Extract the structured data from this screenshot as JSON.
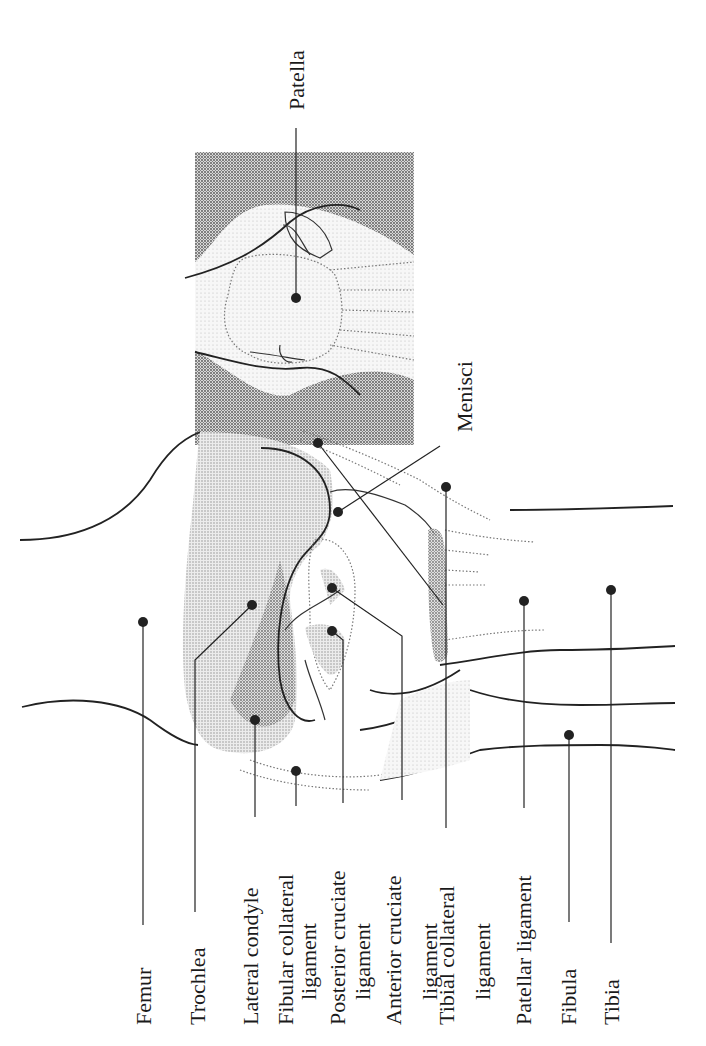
{
  "diagram": {
    "orientation": "rotated -90 degrees; labels read bottom-to-top",
    "labels": {
      "patella": "Patella",
      "menisci": "Menisci",
      "femur": "Femur",
      "trochlea": "Trochlea",
      "lateral_condyle": "Lateral condyle",
      "fibular_collateral_1": "Fibular collateral",
      "fibular_collateral_2": "ligament",
      "posterior_cruciate_1": "Posterior cruciate",
      "posterior_cruciate_2": "ligament",
      "anterior_cruciate_1": "Anterior cruciate",
      "anterior_cruciate_2": "ligament",
      "tibial_collateral_1": "Tibial collateral",
      "tibial_collateral_2": "ligament",
      "patellar_ligament": "Patellar ligament",
      "fibula": "Fibula",
      "tibia": "Tibia"
    },
    "colors": {
      "ink": "#222222",
      "tissue_dark": "#8c8c8c",
      "tissue_mid": "#bdbdbd",
      "tissue_light": "#e2e2e2",
      "background": "#ffffff"
    }
  }
}
